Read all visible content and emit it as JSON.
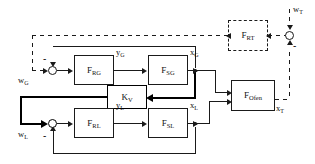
{
  "diagram": {
    "type": "control-block-diagram",
    "background": "#ffffff",
    "line_color": "#1a1a1a"
  },
  "blocks": [
    {
      "id": "f_rt",
      "label": "F",
      "sub": "RT",
      "style": "dashed"
    },
    {
      "id": "f_rg",
      "label": "F",
      "sub": "RG",
      "style": "solid"
    },
    {
      "id": "f_sg",
      "label": "F",
      "sub": "SG",
      "style": "solid"
    },
    {
      "id": "k_v",
      "label": "K",
      "sub": "V",
      "style": "thick"
    },
    {
      "id": "f_rl",
      "label": "F",
      "sub": "RL",
      "style": "solid"
    },
    {
      "id": "f_sl",
      "label": "F",
      "sub": "SL",
      "style": "solid"
    },
    {
      "id": "f_ofen",
      "label": "F",
      "sub": "Ofen",
      "style": "solid"
    }
  ],
  "signals": {
    "w_t": {
      "name": "w",
      "sub": "T"
    },
    "w_g": {
      "name": "w",
      "sub": "G"
    },
    "w_l": {
      "name": "w",
      "sub": "L"
    },
    "y_g": {
      "name": "y",
      "sub": "G"
    },
    "x_g": {
      "name": "x",
      "sub": "G"
    },
    "y_l": {
      "name": "y",
      "sub": "L"
    },
    "x_l": {
      "name": "x",
      "sub": "L"
    },
    "x_t": {
      "name": "x",
      "sub": "T"
    }
  },
  "junctions": {
    "sum_t": {
      "signs": [
        "+",
        "-"
      ]
    },
    "sum_g": {
      "signs": [
        "+",
        "-"
      ]
    },
    "sum_l": {
      "signs": [
        "+",
        "-"
      ]
    }
  },
  "minus_signs": [
    "-",
    "-",
    "-"
  ]
}
